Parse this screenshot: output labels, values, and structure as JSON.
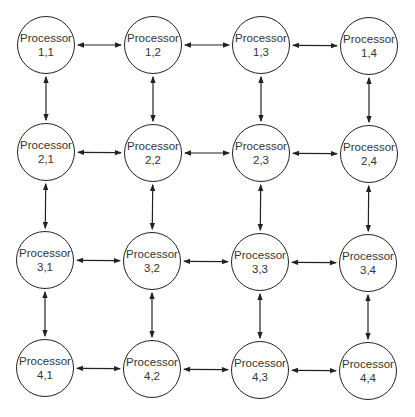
{
  "diagram": {
    "type": "2D mesh of processors",
    "rows": 4,
    "cols": 4,
    "node_label": "Processor",
    "nodes": [
      {
        "label": "Processor",
        "id": "1,1",
        "cx": 46,
        "cy": 45
      },
      {
        "label": "Processor",
        "id": "1,2",
        "cx": 153,
        "cy": 45
      },
      {
        "label": "Processor",
        "id": "1,3",
        "cx": 261,
        "cy": 45
      },
      {
        "label": "Processor",
        "id": "1,4",
        "cx": 369,
        "cy": 46
      },
      {
        "label": "Processor",
        "id": "2,1",
        "cx": 46,
        "cy": 152
      },
      {
        "label": "Processor",
        "id": "2,2",
        "cx": 153,
        "cy": 153
      },
      {
        "label": "Processor",
        "id": "2,3",
        "cx": 261,
        "cy": 153
      },
      {
        "label": "Processor",
        "id": "2,4",
        "cx": 369,
        "cy": 154
      },
      {
        "label": "Processor",
        "id": "3,1",
        "cx": 45,
        "cy": 260
      },
      {
        "label": "Processor",
        "id": "3,2",
        "cx": 152,
        "cy": 261
      },
      {
        "label": "Processor",
        "id": "3,3",
        "cx": 260,
        "cy": 262
      },
      {
        "label": "Processor",
        "id": "3,4",
        "cx": 368,
        "cy": 263
      },
      {
        "label": "Processor",
        "id": "4,1",
        "cx": 45,
        "cy": 368
      },
      {
        "label": "Processor",
        "id": "4,2",
        "cx": 152,
        "cy": 369
      },
      {
        "label": "Processor",
        "id": "4,3",
        "cx": 260,
        "cy": 370
      },
      {
        "label": "Processor",
        "id": "4,4",
        "cx": 368,
        "cy": 371
      }
    ],
    "edges": "bidirectional arrows between horizontally and vertically adjacent processors"
  }
}
